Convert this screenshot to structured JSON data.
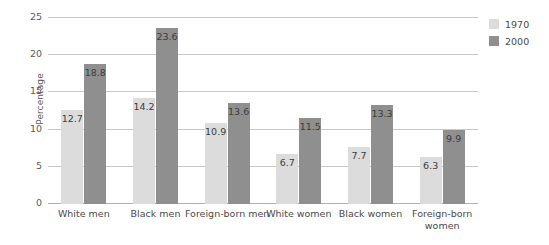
{
  "chart_data": {
    "type": "bar",
    "title": "",
    "xlabel": "",
    "ylabel": "Percentage",
    "ylim": [
      0,
      25
    ],
    "yticks": [
      0,
      5,
      10,
      15,
      20,
      25
    ],
    "ytick_labels": [
      "0",
      "5",
      "10",
      "15",
      "20",
      "25"
    ],
    "grid": true,
    "legend_position": "right",
    "categories": [
      "White men",
      "Black men",
      "Foreign-born men",
      "White women",
      "Black women",
      "Foreign-born women"
    ],
    "series": [
      {
        "name": "1970",
        "color": "#dcdcdc",
        "values": [
          12.7,
          14.2,
          10.9,
          6.7,
          7.7,
          6.3
        ]
      },
      {
        "name": "2000",
        "color": "#8f8f8f",
        "values": [
          18.8,
          23.6,
          13.6,
          11.5,
          13.3,
          9.9
        ]
      }
    ],
    "data_labels": [
      [
        "12.7",
        "14.2",
        "10.9",
        "6.7",
        "7.7",
        "6.3"
      ],
      [
        "18.8",
        "23.6",
        "13.6",
        "11.5",
        "13.3",
        "9.9"
      ]
    ]
  },
  "legend": {
    "items": [
      {
        "label": "1970",
        "color": "#dcdcdc"
      },
      {
        "label": "2000",
        "color": "#8f8f8f"
      }
    ]
  },
  "colors": {
    "series_1970": "#dcdcdc",
    "series_2000": "#8f8f8f",
    "gridline": "#c8c8c8",
    "axis": "#b0b0b0",
    "text": "#4a4a4a",
    "background": "#ffffff"
  }
}
